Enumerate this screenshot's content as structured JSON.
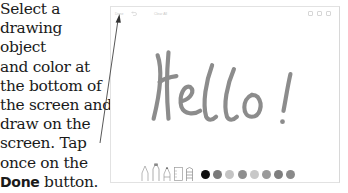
{
  "instructions": {
    "lines": [
      "Select a",
      "drawing object",
      "and color at",
      "the bottom of",
      "the screen and",
      "draw on the",
      "screen. Tap",
      "once on the"
    ],
    "done_word": "Done",
    "done_suffix": " button.",
    "last_line": "The drawing is"
  },
  "device": {
    "toolbar": {
      "done_label": "Done",
      "undo_icon": "undo-icon",
      "clear_label": "Clear All",
      "right_icons": [
        "pen-icon",
        "share-icon",
        "trash-icon"
      ]
    },
    "canvas": {
      "drawn_text": "Hello!",
      "stroke_color": "#8a8a8a"
    },
    "tools": [
      "pen",
      "marker",
      "pencil",
      "eraser",
      "ruler"
    ],
    "colors": [
      "#101010",
      "#7a7a7a",
      "#c4c4c4",
      "#8e8e8e",
      "#c8c8c8",
      "#9a9a9a",
      "#7e7e7e",
      "#8a8a8a"
    ]
  }
}
